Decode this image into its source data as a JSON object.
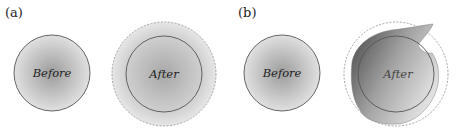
{
  "panels": [
    {
      "id": "a",
      "label": "(a)",
      "before": {
        "label": "Before"
      },
      "after": {
        "label": "After",
        "outline": "dashed expanded circle"
      }
    },
    {
      "id": "b",
      "label": "(b)",
      "before": {
        "label": "Before"
      },
      "after": {
        "label": "After",
        "outline": "dashed circle with distorted shaded shape"
      }
    }
  ],
  "colors": {
    "fill_center": "#9a9a9a",
    "fill_edge": "#e2e2e2",
    "stroke": "#555555",
    "dashed": "#999999"
  }
}
